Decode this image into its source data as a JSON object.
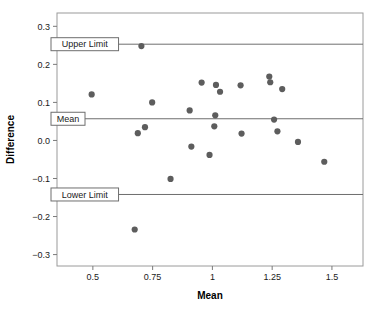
{
  "chart_data": {
    "type": "scatter",
    "title": "",
    "xlabel": "Mean",
    "ylabel": "Difference",
    "xlim": [
      0.35,
      1.63
    ],
    "ylim": [
      -0.33,
      0.335
    ],
    "grid": false,
    "legend": "none",
    "point_color": "#5d5d5d",
    "line_color": "#6e6e6e",
    "xticks": [
      0.5,
      0.75,
      1,
      1.25,
      1.5
    ],
    "xtick_labels": [
      "0.5",
      "0.75",
      "1",
      "1.25",
      "1.5"
    ],
    "yticks": [
      0.3,
      0.2,
      0.1,
      0.0,
      -0.1,
      -0.2,
      -0.3
    ],
    "ytick_labels": [
      "0.3",
      "0.2",
      "0.1",
      "0.0",
      "−0.1",
      "−0.2",
      "−0.3"
    ],
    "reference_lines": [
      {
        "id": "upper-limit",
        "label": "Upper Limit",
        "value": 0.253
      },
      {
        "id": "mean",
        "label": "Mean",
        "value": 0.057
      },
      {
        "id": "lower-limit",
        "label": "Lower Limit",
        "value": -0.142
      }
    ],
    "points": [
      {
        "x": 0.495,
        "y": 0.121
      },
      {
        "x": 0.675,
        "y": -0.234
      },
      {
        "x": 0.688,
        "y": 0.019
      },
      {
        "x": 0.703,
        "y": 0.248
      },
      {
        "x": 0.718,
        "y": 0.035
      },
      {
        "x": 0.748,
        "y": 0.1
      },
      {
        "x": 0.825,
        "y": -0.101
      },
      {
        "x": 0.905,
        "y": 0.079
      },
      {
        "x": 0.912,
        "y": -0.016
      },
      {
        "x": 0.955,
        "y": 0.152
      },
      {
        "x": 0.988,
        "y": -0.038
      },
      {
        "x": 1.008,
        "y": 0.037
      },
      {
        "x": 1.012,
        "y": 0.066
      },
      {
        "x": 1.015,
        "y": 0.146
      },
      {
        "x": 1.032,
        "y": 0.128
      },
      {
        "x": 1.118,
        "y": 0.145
      },
      {
        "x": 1.122,
        "y": 0.018
      },
      {
        "x": 1.238,
        "y": 0.168
      },
      {
        "x": 1.242,
        "y": 0.153
      },
      {
        "x": 1.258,
        "y": 0.055
      },
      {
        "x": 1.272,
        "y": 0.024
      },
      {
        "x": 1.292,
        "y": 0.135
      },
      {
        "x": 1.358,
        "y": -0.004
      },
      {
        "x": 1.468,
        "y": -0.056
      }
    ]
  }
}
